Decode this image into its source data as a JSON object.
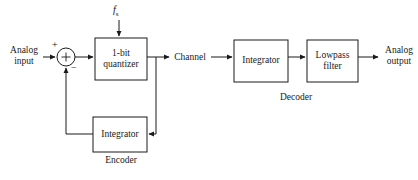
{
  "figure": {
    "type": "block-diagram",
    "background_color": "#ffffff",
    "line_color": "#1a1a1a",
    "text_color": "#1a1a1a"
  },
  "labels": {
    "analog_input_line1": "Analog",
    "analog_input_line2": "input",
    "plus_sign": "+",
    "minus_sign": "−",
    "clock_symbol": "f",
    "clock_subscript": "s",
    "quantizer_line1": "1-bit",
    "quantizer_line2": "quantizer",
    "channel": "Channel",
    "feedback_integrator": "Integrator",
    "encoder": "Encoder",
    "decoder_integrator": "Integrator",
    "lowpass_line1": "Lowpass",
    "lowpass_line2": "filter",
    "decoder": "Decoder",
    "analog_output_line1": "Analog",
    "analog_output_line2": "output"
  },
  "blocks": [
    {
      "name": "quantizer",
      "label": "1-bit quantizer",
      "x": 95,
      "y": 38,
      "w": 52,
      "h": 42
    },
    {
      "name": "feedback-integrator",
      "label": "Integrator",
      "x": 93,
      "y": 117,
      "w": 54,
      "h": 35
    },
    {
      "name": "decoder-integrator",
      "label": "Integrator",
      "x": 234,
      "y": 40,
      "w": 54,
      "h": 42
    },
    {
      "name": "lowpass-filter",
      "label": "Lowpass filter",
      "x": 307,
      "y": 40,
      "w": 51,
      "h": 42
    }
  ],
  "nodes": [
    {
      "name": "summing-junction",
      "type": "circle-sum",
      "cx": 66,
      "cy": 57,
      "r": 9
    }
  ],
  "groups": [
    {
      "name": "encoder",
      "label": "Encoder",
      "caption_x": 120,
      "caption_y": 157
    },
    {
      "name": "decoder",
      "label": "Decoder",
      "caption_x": 296,
      "caption_y": 96
    }
  ],
  "connections": [
    {
      "from": "analog-input",
      "to": "summing-junction",
      "sign": "+"
    },
    {
      "from": "summing-junction",
      "to": "quantizer"
    },
    {
      "from": "clock-fs",
      "to": "quantizer"
    },
    {
      "from": "quantizer",
      "to": "channel"
    },
    {
      "from": "quantizer-tap",
      "to": "feedback-integrator"
    },
    {
      "from": "feedback-integrator",
      "to": "summing-junction",
      "sign": "−"
    },
    {
      "from": "channel",
      "to": "decoder-integrator"
    },
    {
      "from": "decoder-integrator",
      "to": "lowpass-filter"
    },
    {
      "from": "lowpass-filter",
      "to": "analog-output"
    }
  ]
}
